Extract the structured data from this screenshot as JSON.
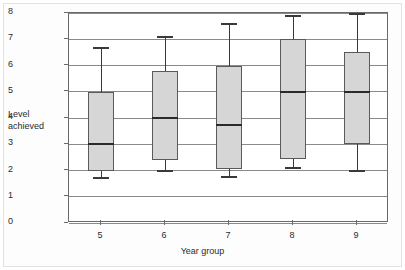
{
  "chart_data": {
    "type": "box",
    "title": "",
    "xlabel": "Year group",
    "ylabel": "Level achieved",
    "ylabel_lines": [
      "Level",
      "achieved"
    ],
    "categories": [
      "5",
      "6",
      "7",
      "8",
      "9"
    ],
    "yticks": [
      "0",
      "1",
      "2",
      "3",
      "4",
      "5",
      "6",
      "7",
      "8"
    ],
    "ylim": [
      0,
      8
    ],
    "grid": "horizontal",
    "legend": "none",
    "boxes": [
      {
        "category": "5",
        "whisker_low": 1.7,
        "q1": 2.0,
        "median": 3.0,
        "q3": 5.0,
        "whisker_high": 6.65
      },
      {
        "category": "6",
        "whisker_low": 2.0,
        "q1": 2.4,
        "median": 4.0,
        "q3": 5.8,
        "whisker_high": 7.1
      },
      {
        "category": "7",
        "whisker_low": 1.75,
        "q1": 2.05,
        "median": 3.75,
        "q3": 6.0,
        "whisker_high": 7.6
      },
      {
        "category": "8",
        "whisker_low": 2.1,
        "q1": 2.45,
        "median": 5.0,
        "q3": 7.0,
        "whisker_high": 7.9
      },
      {
        "category": "9",
        "whisker_low": 2.0,
        "q1": 3.0,
        "median": 5.0,
        "q3": 6.5,
        "whisker_high": 7.95
      }
    ],
    "colors": {
      "box_fill": "#d6d6d6",
      "box_edge": "#5a5a5a",
      "median": "#2a2a2a",
      "whisker": "#3a3a3a",
      "gridline": "#8a8a8a",
      "axis": "#6a6a6a",
      "text": "#2b2b2b",
      "background": "#ffffff"
    }
  }
}
